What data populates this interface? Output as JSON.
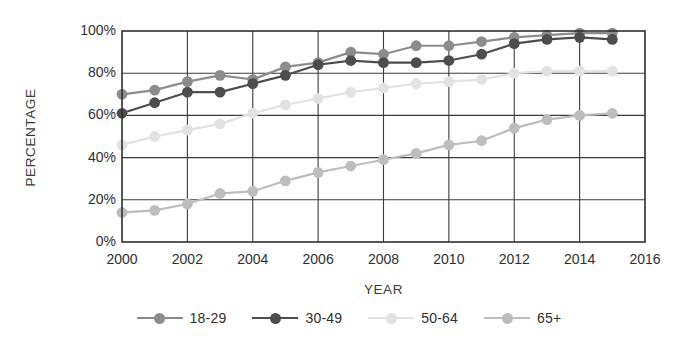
{
  "chart_data": {
    "type": "line",
    "title": "",
    "xlabel": "YEAR",
    "ylabel": "PERCENTAGE",
    "xlim": [
      2000,
      2016
    ],
    "ylim": [
      0,
      100
    ],
    "grid": true,
    "legend_position": "bottom",
    "x_tick_labels": [
      "2000",
      "2002",
      "2004",
      "2006",
      "2008",
      "2010",
      "2012",
      "2014",
      "2016"
    ],
    "x_ticks": [
      2000,
      2002,
      2004,
      2006,
      2008,
      2010,
      2012,
      2014,
      2016
    ],
    "y_tick_labels": [
      "0%",
      "20%",
      "40%",
      "60%",
      "80%",
      "100%"
    ],
    "y_ticks": [
      0,
      20,
      40,
      60,
      80,
      100
    ],
    "x": [
      2000,
      2001,
      2002,
      2003,
      2004,
      2005,
      2006,
      2007,
      2008,
      2009,
      2010,
      2011,
      2012,
      2013,
      2014,
      2015
    ],
    "series": [
      {
        "name": "18-29",
        "color": "#8c8c8c",
        "values": [
          70,
          72,
          76,
          79,
          77,
          83,
          85,
          90,
          89,
          93,
          93,
          95,
          97,
          98,
          99,
          99
        ]
      },
      {
        "name": "30-49",
        "color": "#4d4d4d",
        "values": [
          61,
          66,
          71,
          71,
          75,
          79,
          84,
          86,
          85,
          85,
          86,
          89,
          94,
          96,
          97,
          96
        ]
      },
      {
        "name": "50-64",
        "color": "#e2e2e2",
        "values": [
          46,
          50,
          53,
          56,
          61,
          65,
          68,
          71,
          73,
          75,
          76,
          77,
          80,
          81,
          81,
          81
        ]
      },
      {
        "name": "65+",
        "color": "#bdbdbd",
        "values": [
          14,
          15,
          18,
          23,
          24,
          29,
          33,
          36,
          39,
          42,
          46,
          48,
          54,
          58,
          60,
          61
        ]
      }
    ]
  },
  "legend": {
    "items": [
      {
        "label": "18-29"
      },
      {
        "label": "30-49"
      },
      {
        "label": "50-64"
      },
      {
        "label": "65+"
      }
    ]
  }
}
